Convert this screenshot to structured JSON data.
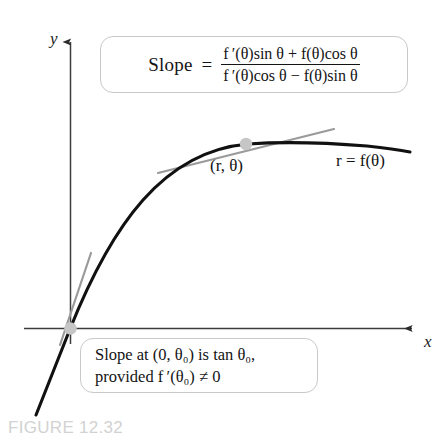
{
  "figure": {
    "caption": "FIGURE 12.32",
    "background_color": "#ffffff",
    "caption_color": "#d2d2d2"
  },
  "axes": {
    "y_label": "y",
    "x_label": "x",
    "axis_color": "#3c3c3c"
  },
  "formula_box": {
    "slope_word": "Slope",
    "equals": "=",
    "numerator": "f ′(θ)sin θ + f(θ)cos θ",
    "denominator": "f ′(θ)cos θ − f(θ)sin θ",
    "border_color": "#c9c9c9"
  },
  "origin_note_box": {
    "line1": "Slope at (0, θ₀) is tan θ₀,",
    "line2": "provided f ′(θ₀) ≠ 0",
    "border_color": "#c9c9c9"
  },
  "curve": {
    "point_label": "(r, θ)",
    "equation_label": "r = f(θ)",
    "curve_color": "#111111",
    "tangent_color": "#8e8e8e",
    "point_marker_color": "#c6c6c6"
  }
}
